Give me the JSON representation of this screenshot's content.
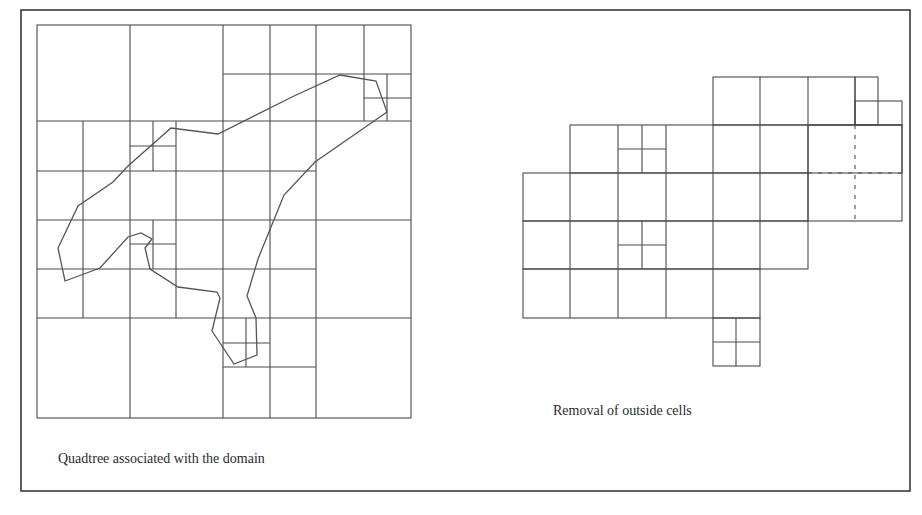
{
  "figure": {
    "frame_color": "#3a3a3a",
    "line_color": "#4a4a4a",
    "polygon_color": "#555555",
    "left_panel": {
      "caption": "Quadtree associated with the domain",
      "description": "Quadtree grid covering a bounding square with an irregular polygonal domain overlaid; cells near the boundary are refined."
    },
    "right_panel": {
      "caption": "Removal of outside cells",
      "description": "The same quadtree after cells lying outside the domain have been removed; one cell shows a dashed subdivision."
    }
  }
}
